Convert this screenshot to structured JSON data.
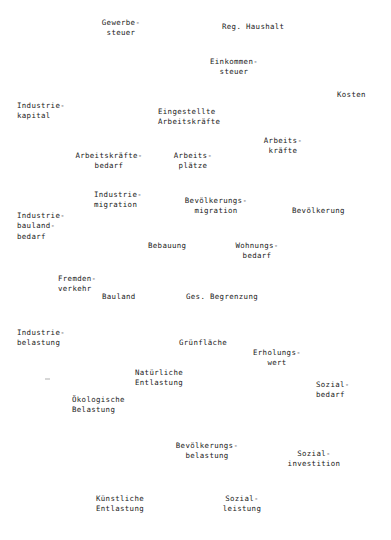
{
  "page": {
    "width": 391,
    "height": 540,
    "background": "#ffffff",
    "text_color": "#1b1b1b",
    "kind": "scanned-typewritten-diagram",
    "language": "de"
  },
  "nodes": [
    {
      "id": "gewerbesteuer",
      "lines": "Gewerbe-\nsteuer",
      "x": 121,
      "y": 18,
      "align": "center"
    },
    {
      "id": "reg-haushalt",
      "lines": "Reg. Haushalt",
      "x": 222,
      "y": 22,
      "align": "left"
    },
    {
      "id": "einkommensteuer",
      "lines": "Einkommen-\nsteuer",
      "x": 234,
      "y": 57,
      "align": "center"
    },
    {
      "id": "kosten",
      "lines": "Kosten",
      "x": 337,
      "y": 90,
      "align": "left"
    },
    {
      "id": "industriekapital",
      "lines": "Industrie-\nkapital",
      "x": 17,
      "y": 101,
      "align": "left"
    },
    {
      "id": "eingestellte-arbeitskraefte",
      "lines": "Eingestellte\nArbeitskräfte",
      "x": 158,
      "y": 107,
      "align": "left"
    },
    {
      "id": "arbeitskraefte",
      "lines": "Arbeits-\nkräfte",
      "x": 283,
      "y": 136,
      "align": "center"
    },
    {
      "id": "arbeitskraeftebedarf",
      "lines": "Arbeitskräfte-\nbedarf",
      "x": 109,
      "y": 151,
      "align": "center"
    },
    {
      "id": "arbeitsplaetze",
      "lines": "Arbeits-\nplätze",
      "x": 193,
      "y": 151,
      "align": "center"
    },
    {
      "id": "industriemigration",
      "lines": "Industrie-\nmigration",
      "x": 94,
      "y": 190,
      "align": "left"
    },
    {
      "id": "bevoelkerungsmigration",
      "lines": "Bevölkerungs-\nmigration",
      "x": 216,
      "y": 196,
      "align": "center"
    },
    {
      "id": "bevoelkerung",
      "lines": "Bevölkerung",
      "x": 292,
      "y": 206,
      "align": "left"
    },
    {
      "id": "industriebaulandbedarf",
      "lines": "Industrie-\nbauland-\nbedarf",
      "x": 17,
      "y": 211,
      "align": "left"
    },
    {
      "id": "bebauung",
      "lines": "Bebauung",
      "x": 148,
      "y": 241,
      "align": "left"
    },
    {
      "id": "wohnungsbedarf",
      "lines": "Wohnungs-\nbedarf",
      "x": 257,
      "y": 241,
      "align": "center"
    },
    {
      "id": "fremdenverkehr",
      "lines": "Fremden-\nverkehr",
      "x": 58,
      "y": 274,
      "align": "left"
    },
    {
      "id": "bauland",
      "lines": "Bauland",
      "x": 102,
      "y": 292,
      "align": "left"
    },
    {
      "id": "ges-begrenzung",
      "lines": "Ges. Begrenzung",
      "x": 186,
      "y": 292,
      "align": "left"
    },
    {
      "id": "industriebelastung",
      "lines": "Industrie-\nbelastung",
      "x": 17,
      "y": 328,
      "align": "left"
    },
    {
      "id": "gruenflaeche",
      "lines": "Grünfläche",
      "x": 179,
      "y": 338,
      "align": "left"
    },
    {
      "id": "erholungswert",
      "lines": "Erholungs-\nwert",
      "x": 277,
      "y": 348,
      "align": "center"
    },
    {
      "id": "natuerliche-entlastung",
      "lines": "Natürliche\nEntlastung",
      "x": 135,
      "y": 368,
      "align": "left"
    },
    {
      "id": "sozialbedarf",
      "lines": "Sozial-\nbedarf",
      "x": 316,
      "y": 380,
      "align": "left"
    },
    {
      "id": "oekologische-belastung",
      "lines": "Ökologische\nBelastung",
      "x": 72,
      "y": 395,
      "align": "left"
    },
    {
      "id": "bevoelkerungsbelastung",
      "lines": "Bevölkerungs-\nbelastung",
      "x": 207,
      "y": 441,
      "align": "center"
    },
    {
      "id": "sozialinvestition",
      "lines": "Sozial-\ninvestition",
      "x": 314,
      "y": 449,
      "align": "center"
    },
    {
      "id": "kuenstliche-entlastung",
      "lines": "Künstliche\nEntlastung",
      "x": 96,
      "y": 494,
      "align": "left"
    },
    {
      "id": "sozialleistung",
      "lines": "Sozial-\nleistung",
      "x": 242,
      "y": 494,
      "align": "center"
    }
  ],
  "artifacts": [
    {
      "id": "scan-speck",
      "x": 45,
      "y": 378
    }
  ]
}
